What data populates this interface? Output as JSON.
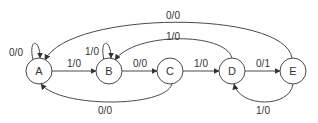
{
  "diagram": {
    "type": "finite-state-machine",
    "states": [
      {
        "id": "A",
        "label": "A"
      },
      {
        "id": "B",
        "label": "B"
      },
      {
        "id": "C",
        "label": "C"
      },
      {
        "id": "D",
        "label": "D"
      },
      {
        "id": "E",
        "label": "E"
      }
    ],
    "transitions": [
      {
        "from": "A",
        "to": "A",
        "label": "0/0"
      },
      {
        "from": "A",
        "to": "B",
        "label": "1/0"
      },
      {
        "from": "B",
        "to": "B",
        "label": "1/0"
      },
      {
        "from": "B",
        "to": "C",
        "label": "0/0"
      },
      {
        "from": "C",
        "to": "D",
        "label": "1/0"
      },
      {
        "from": "D",
        "to": "E",
        "label": "0/1"
      },
      {
        "from": "E",
        "to": "A",
        "label": "0/0"
      },
      {
        "from": "D",
        "to": "B",
        "label": "1/0"
      },
      {
        "from": "C",
        "to": "A",
        "label": "0/0"
      },
      {
        "from": "E",
        "to": "D",
        "label": "1/0"
      }
    ],
    "colors": {
      "stroke": "#4a4a4a",
      "text": "#333333",
      "background": "#ffffff"
    }
  }
}
